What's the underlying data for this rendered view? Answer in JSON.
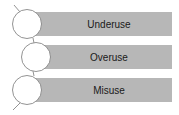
{
  "diagram": {
    "items": [
      {
        "label": "Underuse"
      },
      {
        "label": "Overuse"
      },
      {
        "label": "Misuse"
      }
    ],
    "colors": {
      "bar": "#b7b7b7",
      "circle_fill": "#ffffff",
      "stroke": "#777777"
    }
  }
}
